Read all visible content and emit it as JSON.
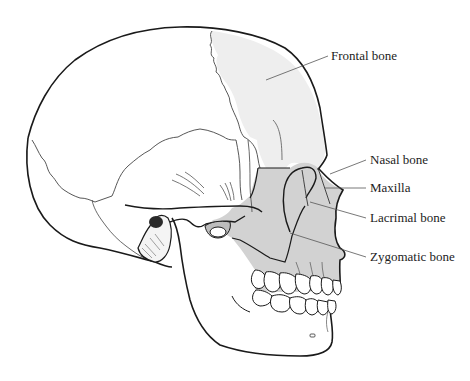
{
  "diagram": {
    "colors": {
      "outline": "#1a1a1a",
      "suture": "#333333",
      "frontal_fill": "#eeeeee",
      "facial_fill": "#d2d2d2",
      "leader_line": "#555555",
      "label_text": "#222222"
    },
    "labels": [
      {
        "id": "frontal",
        "text": "Frontal bone",
        "x": 331,
        "y": 20
      },
      {
        "id": "nasal",
        "text": "Nasal bone",
        "x": 370,
        "y": 160
      },
      {
        "id": "maxilla",
        "text": "Maxilla",
        "x": 370,
        "y": 185
      },
      {
        "id": "lacrimal",
        "text": "Lacrimal bone",
        "x": 370,
        "y": 214
      },
      {
        "id": "zygomatic",
        "text": "Zygomatic bone",
        "x": 370,
        "y": 249
      }
    ]
  }
}
